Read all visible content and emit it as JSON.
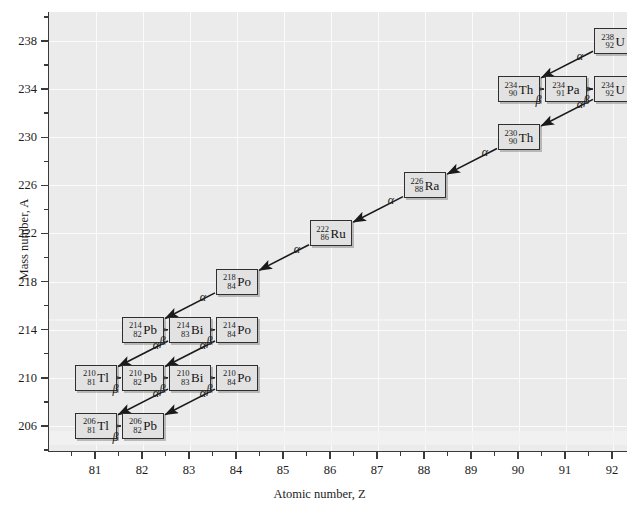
{
  "chart_data": {
    "type": "scatter",
    "title": "",
    "xlabel": "Atomic number, Z",
    "ylabel": "Mass number, A",
    "xlim": [
      80.0,
      92.6
    ],
    "ylim": [
      204.8,
      239.4
    ],
    "xticks": [
      81,
      82,
      83,
      84,
      85,
      86,
      87,
      88,
      89,
      90,
      91,
      92
    ],
    "yticks": [
      206,
      210,
      214,
      218,
      222,
      226,
      230,
      234,
      238
    ],
    "x_minor_step": 0.5,
    "y_minor_step": 2,
    "grid": true,
    "legend": null,
    "nodes": [
      {
        "id": "U238",
        "z": 92,
        "a": 238,
        "mass": "238",
        "number": "92",
        "symbol": "U"
      },
      {
        "id": "Th234",
        "z": 90,
        "a": 234,
        "mass": "234",
        "number": "90",
        "symbol": "Th"
      },
      {
        "id": "Pa234",
        "z": 91,
        "a": 234,
        "mass": "234",
        "number": "91",
        "symbol": "Pa"
      },
      {
        "id": "U234",
        "z": 92,
        "a": 234,
        "mass": "234",
        "number": "92",
        "symbol": "U"
      },
      {
        "id": "Th230",
        "z": 90,
        "a": 230,
        "mass": "230",
        "number": "90",
        "symbol": "Th"
      },
      {
        "id": "Ra226",
        "z": 88,
        "a": 226,
        "mass": "226",
        "number": "88",
        "symbol": "Ra"
      },
      {
        "id": "Rn222",
        "z": 86,
        "a": 222,
        "mass": "222",
        "number": "86",
        "symbol": "Ru"
      },
      {
        "id": "Po218",
        "z": 84,
        "a": 218,
        "mass": "218",
        "number": "84",
        "symbol": "Po"
      },
      {
        "id": "Pb214",
        "z": 82,
        "a": 214,
        "mass": "214",
        "number": "82",
        "symbol": "Pb"
      },
      {
        "id": "Bi214",
        "z": 83,
        "a": 214,
        "mass": "214",
        "number": "83",
        "symbol": "Bi"
      },
      {
        "id": "Po214",
        "z": 84,
        "a": 214,
        "mass": "214",
        "number": "84",
        "symbol": "Po"
      },
      {
        "id": "Tl210",
        "z": 81,
        "a": 210,
        "mass": "210",
        "number": "81",
        "symbol": "Tl"
      },
      {
        "id": "Pb210",
        "z": 82,
        "a": 210,
        "mass": "210",
        "number": "82",
        "symbol": "Pb"
      },
      {
        "id": "Bi210",
        "z": 83,
        "a": 210,
        "mass": "210",
        "number": "83",
        "symbol": "Bi"
      },
      {
        "id": "Po210",
        "z": 84,
        "a": 210,
        "mass": "210",
        "number": "84",
        "symbol": "Po"
      },
      {
        "id": "Tl206",
        "z": 81,
        "a": 206,
        "mass": "206",
        "number": "81",
        "symbol": "Tl"
      },
      {
        "id": "Pb206",
        "z": 82,
        "a": 206,
        "mass": "206",
        "number": "82",
        "symbol": "Pb"
      }
    ],
    "decays": [
      {
        "from": "U238",
        "to": "Th234",
        "type": "alpha",
        "label": "α"
      },
      {
        "from": "Th234",
        "to": "Pa234",
        "type": "beta",
        "label": "β"
      },
      {
        "from": "Pa234",
        "to": "U234",
        "type": "beta",
        "label": "β"
      },
      {
        "from": "U234",
        "to": "Th230",
        "type": "alpha",
        "label": "α"
      },
      {
        "from": "Th230",
        "to": "Ra226",
        "type": "alpha",
        "label": "α"
      },
      {
        "from": "Ra226",
        "to": "Rn222",
        "type": "alpha",
        "label": "α"
      },
      {
        "from": "Rn222",
        "to": "Po218",
        "type": "alpha",
        "label": "α"
      },
      {
        "from": "Po218",
        "to": "Pb214",
        "type": "alpha",
        "label": "α"
      },
      {
        "from": "Pb214",
        "to": "Bi214",
        "type": "beta",
        "label": "β"
      },
      {
        "from": "Bi214",
        "to": "Po214",
        "type": "beta",
        "label": "β"
      },
      {
        "from": "Bi214",
        "to": "Tl210",
        "type": "alpha",
        "label": "α"
      },
      {
        "from": "Po214",
        "to": "Pb210",
        "type": "alpha",
        "label": "α"
      },
      {
        "from": "Tl210",
        "to": "Pb210",
        "type": "beta",
        "label": "β"
      },
      {
        "from": "Pb210",
        "to": "Bi210",
        "type": "beta",
        "label": "β"
      },
      {
        "from": "Bi210",
        "to": "Po210",
        "type": "beta",
        "label": "β"
      },
      {
        "from": "Bi210",
        "to": "Tl206",
        "type": "alpha",
        "label": "α"
      },
      {
        "from": "Po210",
        "to": "Pb206",
        "type": "alpha",
        "label": "α"
      },
      {
        "from": "Tl206",
        "to": "Pb206",
        "type": "beta",
        "label": "β"
      }
    ],
    "colors": {
      "plot_background": "#ebebeb",
      "grid": "#fbfbfb",
      "axis": "#3a3a3a",
      "node_fill": "#e2e2e2",
      "node_border": "#2f2f2f",
      "arrow": "#1a1a1a"
    }
  }
}
